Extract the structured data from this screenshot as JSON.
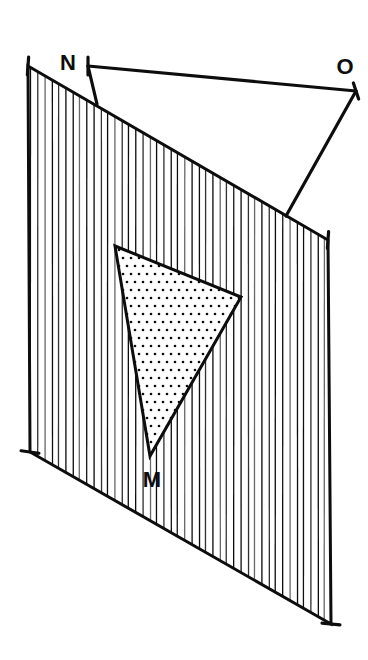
{
  "figure": {
    "background_color": "#ffffff",
    "ink_color": "#0d0d0d",
    "labels": [
      {
        "id": "M",
        "text": "M",
        "x": 152,
        "y": 487,
        "anchor": "middle",
        "font_size": 22
      },
      {
        "id": "N",
        "text": "N",
        "x": 68,
        "y": 70,
        "anchor": "middle",
        "font_size": 22
      },
      {
        "id": "O",
        "text": "O",
        "x": 345,
        "y": 74,
        "anchor": "middle",
        "font_size": 22
      }
    ],
    "plane": {
      "name": "hatched-plane",
      "fill": "#ffffff",
      "stroke": "#0d0d0d",
      "stroke_width": 3,
      "hatch_style": "vertical-lines",
      "hatch_spacing": 7,
      "hatch_stroke_width": 1.3,
      "corners": [
        {
          "id": "top-left",
          "x": 28,
          "y": 66
        },
        {
          "id": "top-right",
          "x": 328,
          "y": 240
        },
        {
          "id": "bottom-right",
          "x": 331,
          "y": 624
        },
        {
          "id": "bottom-left",
          "x": 30,
          "y": 452
        }
      ]
    },
    "shaded_triangle": {
      "name": "dotted-triangle",
      "fill_style": "dot-stipple",
      "dot_color": "#0d0d0d",
      "dot_spacing": 8,
      "dot_radius": 1.35,
      "stroke": "#0d0d0d",
      "stroke_width": 3,
      "vertices": [
        {
          "id": "apex-top-left",
          "x": 115,
          "y": 246
        },
        {
          "id": "apex-right",
          "x": 241,
          "y": 297
        },
        {
          "id": "M",
          "x": 150,
          "y": 456
        }
      ]
    },
    "construction_lines": [
      {
        "id": "N-to-O",
        "name": "line-n-to-o",
        "from": {
          "x": 88,
          "y": 66
        },
        "to": {
          "x": 356,
          "y": 91
        },
        "stroke_width": 3.2
      },
      {
        "id": "N-to-plane",
        "name": "line-n-to-plane",
        "from": {
          "x": 88,
          "y": 66
        },
        "to": {
          "x": 97,
          "y": 104
        },
        "stroke_width": 3.2
      },
      {
        "id": "O-to-plane",
        "name": "line-o-to-plane",
        "from": {
          "x": 356,
          "y": 91
        },
        "to": {
          "x": 286,
          "y": 216
        },
        "stroke_width": 3.2
      }
    ],
    "tick_marks": [
      {
        "id": "tick-N",
        "name": "tick-mark-n",
        "cx": 88,
        "cy": 66,
        "angle": 90,
        "length": 18
      },
      {
        "id": "tick-O",
        "name": "tick-mark-o",
        "cx": 356,
        "cy": 91,
        "angle": 72,
        "length": 17
      },
      {
        "id": "tick-plane-tl",
        "name": "tick-mark-plane-top-left",
        "cx": 28,
        "cy": 66,
        "angle": 94,
        "length": 18
      },
      {
        "id": "tick-plane-bl",
        "name": "tick-mark-plane-bottom-left",
        "cx": 30,
        "cy": 452,
        "angle": 8,
        "length": 18
      },
      {
        "id": "tick-plane-tr",
        "name": "tick-mark-plane-top-right",
        "cx": 328,
        "cy": 240,
        "angle": 94,
        "length": 17
      },
      {
        "id": "tick-plane-br",
        "name": "tick-mark-plane-bottom-right",
        "cx": 331,
        "cy": 624,
        "angle": 6,
        "length": 18
      }
    ]
  }
}
